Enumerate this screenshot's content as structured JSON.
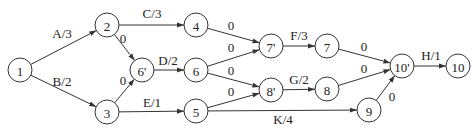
{
  "diagram": {
    "type": "activity-on-arrow network",
    "nodes": [
      {
        "id": "1",
        "label": "1",
        "x": 20,
        "y": 70
      },
      {
        "id": "2",
        "label": "2",
        "x": 107,
        "y": 25
      },
      {
        "id": "3",
        "label": "3",
        "x": 107,
        "y": 112
      },
      {
        "id": "6p",
        "label": "6'",
        "x": 142,
        "y": 70
      },
      {
        "id": "4",
        "label": "4",
        "x": 196,
        "y": 25
      },
      {
        "id": "6",
        "label": "6",
        "x": 196,
        "y": 70
      },
      {
        "id": "5",
        "label": "5",
        "x": 196,
        "y": 111
      },
      {
        "id": "7p",
        "label": "7'",
        "x": 271,
        "y": 46
      },
      {
        "id": "8p",
        "label": "8'",
        "x": 271,
        "y": 90
      },
      {
        "id": "7",
        "label": "7",
        "x": 327,
        "y": 46
      },
      {
        "id": "8",
        "label": "8",
        "x": 327,
        "y": 89
      },
      {
        "id": "9",
        "label": "9",
        "x": 369,
        "y": 110
      },
      {
        "id": "10p",
        "label": "10'",
        "x": 402,
        "y": 66
      },
      {
        "id": "10",
        "label": "10",
        "x": 458,
        "y": 66
      }
    ],
    "edges": [
      {
        "from": "1",
        "to": "2",
        "label": "A/3",
        "lx": 62,
        "ly": 38
      },
      {
        "from": "1",
        "to": "3",
        "label": "B/2",
        "lx": 62,
        "ly": 86
      },
      {
        "from": "2",
        "to": "4",
        "label": "C/3",
        "lx": 152,
        "ly": 18
      },
      {
        "from": "2",
        "to": "6p",
        "label": "0",
        "lx": 123,
        "ly": 43
      },
      {
        "from": "3",
        "to": "6p",
        "label": "0",
        "lx": 123,
        "ly": 85
      },
      {
        "from": "6p",
        "to": "6",
        "label": "D/2",
        "lx": 168,
        "ly": 65
      },
      {
        "from": "3",
        "to": "5",
        "label": "E/1",
        "lx": 152,
        "ly": 107
      },
      {
        "from": "4",
        "to": "7p",
        "label": "0",
        "lx": 231,
        "ly": 30
      },
      {
        "from": "6",
        "to": "7p",
        "label": "0",
        "lx": 231,
        "ly": 52
      },
      {
        "from": "6",
        "to": "8p",
        "label": "0",
        "lx": 231,
        "ly": 75
      },
      {
        "from": "5",
        "to": "8p",
        "label": "0",
        "lx": 231,
        "ly": 96
      },
      {
        "from": "7p",
        "to": "7",
        "label": "F/3",
        "lx": 299,
        "ly": 40
      },
      {
        "from": "8p",
        "to": "8",
        "label": "G/2",
        "lx": 299,
        "ly": 84
      },
      {
        "from": "5",
        "to": "9",
        "label": "K/4",
        "lx": 283,
        "ly": 124
      },
      {
        "from": "7",
        "to": "10p",
        "label": "0",
        "lx": 364,
        "ly": 51
      },
      {
        "from": "8",
        "to": "10p",
        "label": "0",
        "lx": 364,
        "ly": 73
      },
      {
        "from": "9",
        "to": "10p",
        "label": "0",
        "lx": 392,
        "ly": 101
      },
      {
        "from": "10p",
        "to": "10",
        "label": "H/1",
        "lx": 431,
        "ly": 60
      }
    ]
  }
}
